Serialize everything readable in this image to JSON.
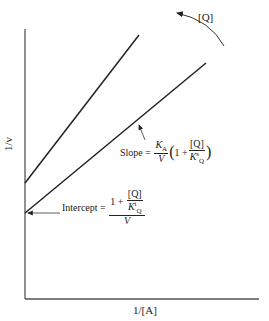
{
  "diagram": {
    "type": "double-reciprocal plot (Lineweaver-Burk)",
    "axes": {
      "y_label": "1/v",
      "x_label": "1/[A]"
    },
    "arrow_label": "[Q]",
    "slope_label": {
      "prefix": "Slope =",
      "k_a": "K",
      "k_a_sub": "A",
      "v": "V",
      "one_plus": "1 +",
      "q": "[Q]",
      "k_q": "K",
      "k_q_sup": "s",
      "k_q_sub": "Q"
    },
    "intercept_label": {
      "prefix": "Intercept =",
      "one_plus": "1 +",
      "q": "[Q]",
      "k_q": "K",
      "k_q_sup": "i",
      "k_q_sub": "Q",
      "v": "V"
    },
    "colors": {
      "line": "#222222",
      "axis": "#555555",
      "background": "#ffffff"
    }
  }
}
